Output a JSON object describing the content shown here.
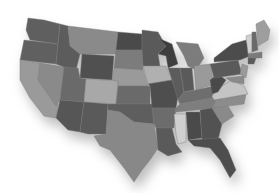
{
  "map": {
    "title": "",
    "subject": "United States (contiguous) states, grayscale",
    "background": "#ffffff",
    "shadow_color": "#bdbdbd",
    "states": [
      {
        "id": "WA",
        "fill": "#5f5f5f",
        "points": "28,18 44,20 60,24 58,44 30,40 26,30"
      },
      {
        "id": "OR",
        "fill": "#606060",
        "points": "24,40 58,44 56,64 20,60 22,50"
      },
      {
        "id": "CA",
        "fill": "#9a9a9a",
        "points": "20,60 40,63 38,80 58,104 56,118 44,116 30,98 20,80"
      },
      {
        "id": "NV",
        "fill": "#8a8a8a",
        "points": "40,63 64,67 60,100 56,106 38,80"
      },
      {
        "id": "ID",
        "fill": "#5c5c5c",
        "points": "60,24 68,26 70,46 80,54 76,70 64,67 56,64 58,44"
      },
      {
        "id": "MT",
        "fill": "#8a8a8a",
        "points": "68,26 118,32 116,54 80,54 70,46"
      },
      {
        "id": "WY",
        "fill": "#505050",
        "points": "82,54 114,56 112,80 80,78"
      },
      {
        "id": "UT",
        "fill": "#6a6a6a",
        "points": "64,67 78,68 80,78 86,79 84,102 60,100"
      },
      {
        "id": "CO",
        "fill": "#a8a8a8",
        "points": "86,79 118,81 116,104 84,102"
      },
      {
        "id": "AZ",
        "fill": "#565656",
        "points": "60,100 84,102 80,132 68,130 56,118"
      },
      {
        "id": "NM",
        "fill": "#5a5a5a",
        "points": "84,102 108,104 106,134 88,134 80,132"
      },
      {
        "id": "ND",
        "fill": "#4a4a4a",
        "points": "118,32 142,34 142,50 116,50"
      },
      {
        "id": "SD",
        "fill": "#7c7c7c",
        "points": "116,50 142,50 143,70 114,68"
      },
      {
        "id": "NE",
        "fill": "#9a9a9a",
        "points": "114,68 143,70 148,86 118,86 118,81 112,80"
      },
      {
        "id": "KS",
        "fill": "#6a6a6a",
        "points": "118,86 150,86 150,104 116,104"
      },
      {
        "id": "OK",
        "fill": "#5e5e5e",
        "points": "108,104 152,104 154,124 134,122 120,112 108,110"
      },
      {
        "id": "TX",
        "fill": "#888888",
        "points": "108,110 120,112 134,122 154,124 158,148 150,160 142,170 134,182 124,168 110,150 100,146 94,136 106,134"
      },
      {
        "id": "MN",
        "fill": "#5a5a5a",
        "points": "142,30 158,32 166,46 158,54 160,66 143,66 142,50"
      },
      {
        "id": "IA",
        "fill": "#b0b0b0",
        "points": "143,66 166,66 172,80 148,84"
      },
      {
        "id": "MO",
        "fill": "#4e4e4e",
        "points": "148,84 172,80 178,96 176,108 152,108 150,86"
      },
      {
        "id": "AR",
        "fill": "#6c6c6c",
        "points": "152,108 176,108 174,128 156,128 154,124"
      },
      {
        "id": "LA",
        "fill": "#5a5a5a",
        "points": "156,128 172,128 176,144 182,152 168,156 158,150"
      },
      {
        "id": "WI",
        "fill": "#3e3e3e",
        "points": "158,38 172,44 178,64 168,68 166,56 158,54 166,46"
      },
      {
        "id": "IL",
        "fill": "#5c5c5c",
        "points": "168,68 180,68 184,92 178,100 172,80"
      },
      {
        "id": "MI",
        "fill": "#7c7c7c",
        "points": "176,42 198,44 204,58 196,70 188,66 184,56"
      },
      {
        "id": "IN",
        "fill": "#5a5a5a",
        "points": "180,68 192,68 194,90 184,92"
      },
      {
        "id": "OH",
        "fill": "#9a9a9a",
        "points": "194,66 210,64 214,84 196,90"
      },
      {
        "id": "KY",
        "fill": "#6e6e6e",
        "points": "178,100 184,92 196,90 214,86 212,98 180,104"
      },
      {
        "id": "TN",
        "fill": "#7e7e7e",
        "points": "176,108 180,104 212,98 222,98 216,108 176,112"
      },
      {
        "id": "MS",
        "fill": "#cfcfcf",
        "points": "174,114 186,114 186,142 178,144 176,134"
      },
      {
        "id": "AL",
        "fill": "#4a4a4a",
        "points": "186,112 200,112 202,138 188,140"
      },
      {
        "id": "GA",
        "fill": "#525252",
        "points": "200,110 212,108 222,124 218,140 202,140"
      },
      {
        "id": "FL",
        "fill": "#4e4e4e",
        "points": "188,140 220,138 228,150 236,170 230,178 220,160 210,148 194,146"
      },
      {
        "id": "SC",
        "fill": "#8a8a8a",
        "points": "212,108 228,106 234,116 222,124"
      },
      {
        "id": "NC",
        "fill": "#8c8c8c",
        "points": "216,100 246,94 244,104 228,106 212,108"
      },
      {
        "id": "VA",
        "fill": "#c4c4c4",
        "points": "212,96 222,86 232,80 244,86 248,94 214,100"
      },
      {
        "id": "WV",
        "fill": "#4a4a4a",
        "points": "210,80 218,74 226,80 218,92 212,94"
      },
      {
        "id": "PA",
        "fill": "#5a5a5a",
        "points": "210,64 238,60 242,74 214,78"
      },
      {
        "id": "NY",
        "fill": "#4c4c4c",
        "points": "214,58 232,44 246,40 250,56 240,60 214,62"
      },
      {
        "id": "MD",
        "fill": "#8a8a8a",
        "points": "226,78 244,76 244,84 232,82"
      },
      {
        "id": "NJ",
        "fill": "#9a9a9a",
        "points": "242,64 248,66 246,78 240,74"
      },
      {
        "id": "VT",
        "fill": "#d0d0d0",
        "points": "246,36 252,34 252,52 248,54"
      },
      {
        "id": "NH",
        "fill": "#6a6a6a",
        "points": "252,32 256,32 258,50 252,52"
      },
      {
        "id": "ME",
        "fill": "#9e9e9e",
        "points": "256,24 264,20 270,30 268,40 258,46"
      },
      {
        "id": "MA",
        "fill": "#7a7a7a",
        "points": "248,54 262,52 262,58 248,58"
      },
      {
        "id": "CT",
        "fill": "#5a5a5a",
        "points": "248,58 256,58 254,64 248,64"
      }
    ]
  }
}
